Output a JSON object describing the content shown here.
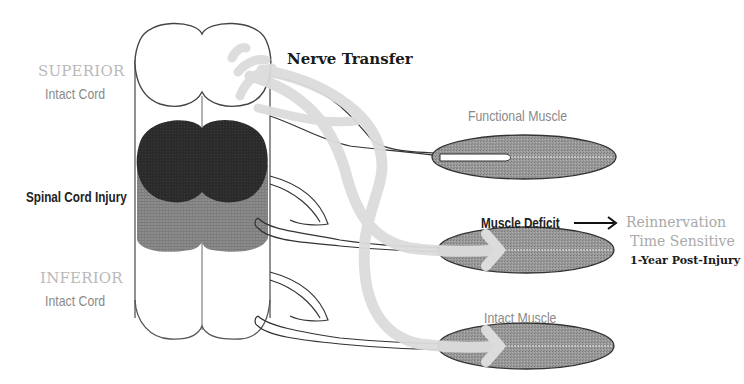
{
  "diagram": {
    "title_hint": "Nerve transfer across spinal cord injury",
    "cord_labels": {
      "superior_top": "SUPERIOR",
      "superior_bottom": "Intact Cord",
      "injury": "Spinal Cord Injury",
      "inferior_top": "INFERIOR",
      "inferior_bottom": "Intact Cord"
    },
    "nerve_transfer_label": "Nerve Transfer",
    "muscles": [
      {
        "label": "Functional Muscle",
        "state": "functional"
      },
      {
        "label": "Muscle Deficit",
        "state": "deficit"
      },
      {
        "label": "Intact Muscle",
        "state": "intact"
      }
    ],
    "deficit_note": {
      "line1": "Reinnervation",
      "line2": "Time Sensitive",
      "line3": "1-Year Post-Injury"
    },
    "colors": {
      "injury_dark": "#2b2b2b",
      "injury_gray": "#8f8f8f",
      "muscle_fill": "#9a9a9a",
      "transfer_path": "#dcdcdc",
      "outline": "#444444",
      "label_light": "#b9b9b9",
      "label_mid": "#8a8a8a",
      "label_dark": "#222222"
    }
  }
}
